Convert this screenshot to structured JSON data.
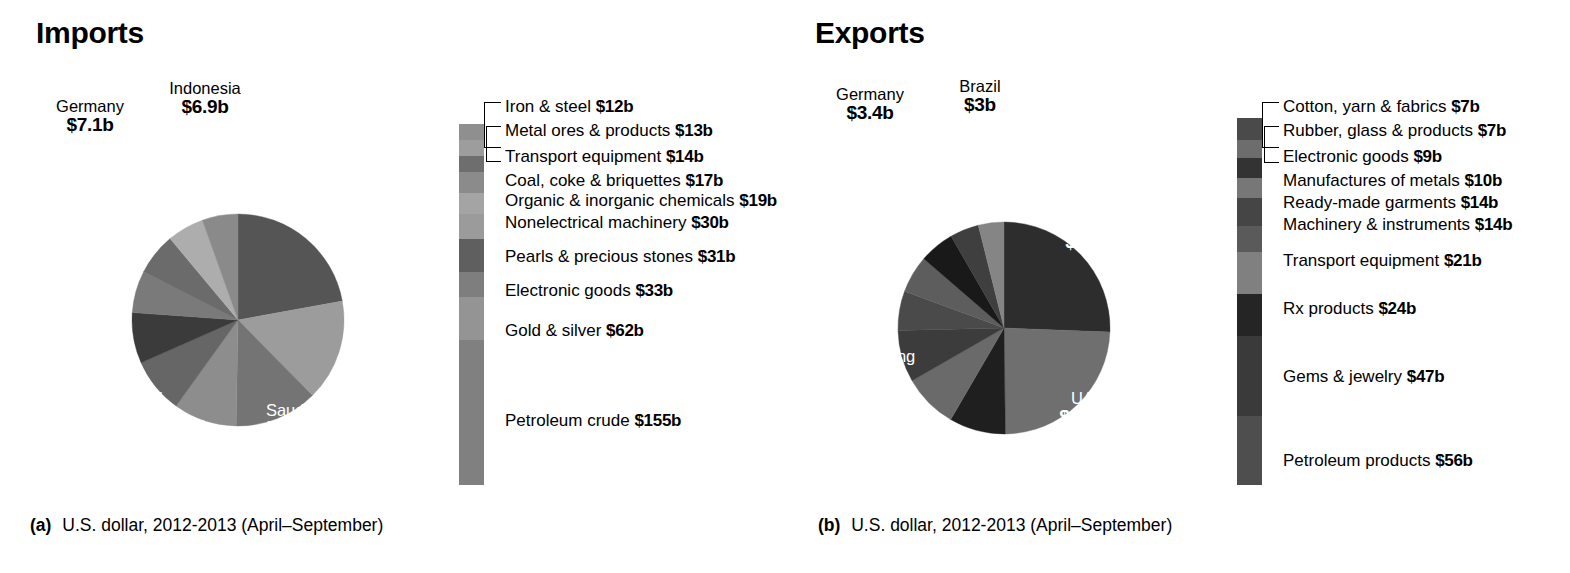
{
  "panels": [
    {
      "id": "a",
      "title": "Imports",
      "caption_tag": "(a)",
      "caption_text": "U.S. dollar, 2012-2013 (April–September)",
      "pie": {
        "center_label_note": "countries by import value, US$ billions",
        "slices": [
          {
            "name": "China",
            "value": 28.0,
            "label_value": "$28b",
            "color": "#555555",
            "label_pos": "inside"
          },
          {
            "name": "UAE",
            "value": 19.6,
            "label_value": "$19.6b",
            "color": "#9c9c9c",
            "label_pos": "inside"
          },
          {
            "name": "Saudi Arabia",
            "value": 16.0,
            "label_value": "$16b",
            "color": "#747474",
            "label_pos": "inside"
          },
          {
            "name": "USA",
            "value": 12.2,
            "label_value": "$12.2b",
            "color": "#8d8d8d",
            "label_pos": "inside"
          },
          {
            "name": "Switzerland",
            "value": 10.7,
            "label_value": "$10.7b",
            "color": "#666666",
            "label_pos": "inside"
          },
          {
            "name": "Iraq",
            "value": 9.8,
            "label_value": "$9.8b",
            "color": "#3b3b3b",
            "label_pos": "inside"
          },
          {
            "name": "Qatar",
            "value": 8.1,
            "label_value": "$8.1b",
            "color": "#7a7a7a",
            "label_pos": "inside"
          },
          {
            "name": "Kuwait",
            "value": 8.1,
            "label_value": "$8.1b",
            "color": "#6b6b6b",
            "label_pos": "inside"
          },
          {
            "name": "Germany",
            "value": 7.1,
            "label_value": "$7.1b",
            "color": "#adadad",
            "label_pos": "outside"
          },
          {
            "name": "Indonesia",
            "value": 6.9,
            "label_value": "$6.9b",
            "color": "#8a8a8a",
            "label_pos": "outside"
          }
        ]
      },
      "legend": {
        "items": [
          {
            "label": "Iron & steel",
            "value": "$12b",
            "color": "#8f8f8f"
          },
          {
            "label": "Metal ores & products",
            "value": "$13b",
            "color": "#9d9d9d"
          },
          {
            "label": "Transport equipment",
            "value": "$14b",
            "color": "#6e6e6e"
          },
          {
            "label": "Coal, coke & briquettes",
            "value": "$17b",
            "color": "#8b8b8b"
          },
          {
            "label": "Organic & inorganic chemicals",
            "value": "$19b",
            "color": "#a4a4a4"
          },
          {
            "label": "Nonelectrical machinery",
            "value": "$30b",
            "color": "#9b9b9b"
          },
          {
            "label": "Pearls & precious stones",
            "value": "$31b",
            "color": "#5f5f5f"
          },
          {
            "label": "Electronic goods",
            "value": "$33b",
            "color": "#7e7e7e"
          },
          {
            "label": "Gold & silver",
            "value": "$62b",
            "color": "#949494"
          },
          {
            "label": "Petroleum crude",
            "value": "$155b",
            "color": "#808080"
          }
        ]
      }
    },
    {
      "id": "b",
      "title": "Exports",
      "caption_tag": "(b)",
      "caption_text": "U.S. dollar, 2012-2013 (April–September)",
      "pie": {
        "center_label_note": "countries by export value, US$ billions",
        "slices": [
          {
            "name": "USA",
            "value": 19.7,
            "label_value": "$19.7b",
            "color": "#2d2d2d",
            "label_pos": "inside"
          },
          {
            "name": "UAE",
            "value": 18.6,
            "label_value": "$18.6b",
            "color": "#6f6f6f",
            "label_pos": "inside"
          },
          {
            "name": "Singapore",
            "value": 6.6,
            "label_value": "$6.6b",
            "color": "#1f1f1f",
            "label_pos": "inside"
          },
          {
            "name": "China",
            "value": 6.4,
            "label_value": "$6.4b",
            "color": "#6a6a6a",
            "label_pos": "inside"
          },
          {
            "name": "Hong Kong",
            "value": 6.1,
            "label_value": "$6.1b",
            "color": "#3c3c3c",
            "label_pos": "inside"
          },
          {
            "name": "Saudi Arabia",
            "value": 4.6,
            "label_value": "$4.6b",
            "color": "#4a4a4a",
            "label_pos": "inside"
          },
          {
            "name": "Netherlands",
            "value": 4.4,
            "label_value": "$4.4b",
            "color": "#5d5d5d",
            "label_pos": "inside"
          },
          {
            "name": "UK",
            "value": 4.1,
            "label_value": "$4.1b",
            "color": "#191919",
            "label_pos": "inside"
          },
          {
            "name": "Germany",
            "value": 3.4,
            "label_value": "$3.4b",
            "color": "#3f3f3f",
            "label_pos": "outside"
          },
          {
            "name": "Brazil",
            "value": 3.0,
            "label_value": "$3b",
            "color": "#858585",
            "label_pos": "outside"
          }
        ]
      },
      "legend": {
        "items": [
          {
            "label": "Cotton, yarn & fabrics",
            "value": "$7b",
            "color": "#4a4a4a"
          },
          {
            "label": "Rubber, glass & products",
            "value": "$7b",
            "color": "#6d6d6d"
          },
          {
            "label": "Electronic goods",
            "value": "$9b",
            "color": "#333333"
          },
          {
            "label": "Manufactures of metals",
            "value": "$10b",
            "color": "#777777"
          },
          {
            "label": "Ready-made garments",
            "value": "$14b",
            "color": "#454545"
          },
          {
            "label": "Machinery & instruments",
            "value": "$14b",
            "color": "#5a5a5a"
          },
          {
            "label": "Transport equipment",
            "value": "$21b",
            "color": "#808080"
          },
          {
            "label": "Rx products",
            "value": "$24b",
            "color": "#252525"
          },
          {
            "label": "Gems & jewelry",
            "value": "$47b",
            "color": "#3a3a3a"
          },
          {
            "label": "Petroleum products",
            "value": "$56b",
            "color": "#4e4e4e"
          }
        ]
      }
    }
  ],
  "chart_data": {
    "type": "pie",
    "units": "US$ billions",
    "charts": [
      {
        "subtitle": "Imports",
        "panel": "(a)",
        "axis_note": "U.S. dollar, 2012-2013 (April–September)",
        "by_country": {
          "labels": [
            "China",
            "UAE",
            "Saudi Arabia",
            "USA",
            "Switzerland",
            "Iraq",
            "Qatar",
            "Kuwait",
            "Germany",
            "Indonesia"
          ],
          "values": [
            28.0,
            19.6,
            16.0,
            12.2,
            10.7,
            9.8,
            8.1,
            8.1,
            7.1,
            6.9
          ]
        },
        "by_commodity": {
          "labels": [
            "Iron & steel",
            "Metal ores & products",
            "Transport equipment",
            "Coal, coke & briquettes",
            "Organic & inorganic chemicals",
            "Nonelectrical machinery",
            "Pearls & precious stones",
            "Electronic goods",
            "Gold & silver",
            "Petroleum crude"
          ],
          "values": [
            12,
            13,
            14,
            17,
            19,
            30,
            31,
            33,
            62,
            155
          ]
        }
      },
      {
        "subtitle": "Exports",
        "panel": "(b)",
        "axis_note": "U.S. dollar, 2012-2013 (April–September)",
        "by_country": {
          "labels": [
            "USA",
            "UAE",
            "Singapore",
            "China",
            "Hong Kong",
            "Saudi Arabia",
            "Netherlands",
            "UK",
            "Germany",
            "Brazil"
          ],
          "values": [
            19.7,
            18.6,
            6.6,
            6.4,
            6.1,
            4.6,
            4.4,
            4.1,
            3.4,
            3.0
          ]
        },
        "by_commodity": {
          "labels": [
            "Cotton, yarn & fabrics",
            "Rubber, glass & products",
            "Electronic goods",
            "Manufactures of metals",
            "Ready-made garments",
            "Machinery & instruments",
            "Transport equipment",
            "Rx products",
            "Gems & jewelry",
            "Petroleum products"
          ],
          "values": [
            7,
            7,
            9,
            10,
            14,
            14,
            21,
            24,
            47,
            56
          ]
        }
      }
    ],
    "legend": "stacked color bar beside each pie listing commodity categories",
    "grid": false
  },
  "label_positions": {
    "a": {
      "inside": [
        {
          "i": 0,
          "x": 268,
          "y": 198,
          "w": 100,
          "align": "center"
        },
        {
          "i": 1,
          "x": 328,
          "y": 304,
          "w": 90,
          "align": "center"
        },
        {
          "i": 2,
          "x": 242,
          "y": 402,
          "w": 90,
          "align": "center"
        },
        {
          "i": 3,
          "x": 148,
          "y": 418,
          "w": 86,
          "align": "center"
        },
        {
          "i": 4,
          "x": 60,
          "y": 390,
          "w": 120,
          "align": "center"
        },
        {
          "i": 5,
          "x": 58,
          "y": 324,
          "w": 80,
          "align": "center"
        },
        {
          "i": 6,
          "x": 44,
          "y": 265,
          "w": 82,
          "align": "center"
        },
        {
          "i": 7,
          "x": 62,
          "y": 200,
          "w": 86,
          "align": "center"
        }
      ],
      "outside": [
        {
          "i": 8,
          "x": 38,
          "y": 98,
          "w": 104,
          "align": "center"
        },
        {
          "i": 9,
          "x": 150,
          "y": 80,
          "w": 110,
          "align": "center"
        }
      ]
    },
    "b": {
      "inside": [
        {
          "i": 0,
          "x": 1046,
          "y": 215,
          "w": 96,
          "align": "center"
        },
        {
          "i": 1,
          "x": 1040,
          "y": 390,
          "w": 96,
          "align": "center"
        },
        {
          "i": 2,
          "x": 930,
          "y": 455,
          "w": 104,
          "align": "center"
        },
        {
          "i": 3,
          "x": 852,
          "y": 410,
          "w": 84,
          "align": "center"
        },
        {
          "i": 4,
          "x": 820,
          "y": 348,
          "w": 108,
          "align": "center"
        },
        {
          "i": 5,
          "x": 806,
          "y": 276,
          "w": 100,
          "align": "left"
        },
        {
          "i": 6,
          "x": 812,
          "y": 232,
          "w": 116,
          "align": "center"
        },
        {
          "i": 7,
          "x": 854,
          "y": 178,
          "w": 70,
          "align": "center"
        }
      ],
      "outside": [
        {
          "i": 8,
          "x": 820,
          "y": 86,
          "w": 100,
          "align": "center"
        },
        {
          "i": 9,
          "x": 938,
          "y": 78,
          "w": 84,
          "align": "center"
        }
      ]
    }
  },
  "legend_geometry": {
    "a": {
      "bar_left": 459,
      "bar_top": 124,
      "bar_height": 361,
      "rows_left": 505,
      "row_tops": [
        98,
        122,
        148,
        172,
        192,
        214,
        248,
        282,
        322,
        412
      ],
      "band_heights": [
        16,
        16,
        16,
        21,
        21,
        25,
        33,
        25,
        43,
        145
      ]
    },
    "b": {
      "bar_left": 1237,
      "bar_top": 118,
      "bar_height": 367,
      "rows_left": 1283,
      "row_tops": [
        98,
        122,
        148,
        172,
        194,
        216,
        252,
        300,
        368,
        452
      ],
      "band_heights": [
        22,
        18,
        20,
        20,
        28,
        26,
        42,
        42,
        80,
        69
      ]
    }
  },
  "captions": {
    "a": {
      "left": 30,
      "top": 515
    },
    "b": {
      "left": 818,
      "top": 515
    }
  }
}
